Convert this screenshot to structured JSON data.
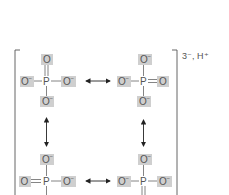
{
  "diagram": {
    "charge_label": "3⁻, H⁺",
    "structures": [
      {
        "id": "top-left",
        "center": "P",
        "top": "O",
        "left": "O⁻",
        "right": "O⁻",
        "bottom": "O⁻",
        "double_bond": "top"
      },
      {
        "id": "top-right",
        "center": "P",
        "top": "O⁻",
        "left": "O⁻",
        "right": "O",
        "bottom": "O⁻",
        "double_bond": "right"
      },
      {
        "id": "bottom-left",
        "center": "P",
        "top": "O⁻",
        "left": "O",
        "right": "O⁻",
        "bottom": "",
        "double_bond": "left"
      },
      {
        "id": "bottom-right",
        "center": "P",
        "top": "O⁻",
        "left": "O⁻",
        "right": "O⁻",
        "bottom": "",
        "double_bond": "bottom"
      }
    ],
    "arrows": [
      "top-horizontal",
      "left-vertical",
      "right-vertical",
      "bottom-horizontal"
    ],
    "colors": {
      "atom_highlight": "#cfcfcf",
      "text": "#555555",
      "arrow": "#222222"
    }
  }
}
